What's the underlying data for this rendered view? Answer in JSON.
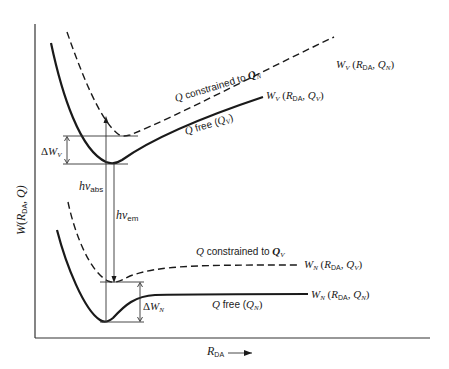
{
  "diagram": {
    "y_axis_label": {
      "main": "W",
      "open": "(",
      "sub_var": "R",
      "sub": "DA",
      "rest": ", Q)"
    },
    "x_axis_label": {
      "main": "R",
      "sub": "DA"
    },
    "curves": {
      "upper_dashed": {
        "annotation": {
          "q": "Q",
          "text": " constrained to ",
          "q2": "Q",
          "q2_sub": "N"
        },
        "end_label": {
          "w": "W",
          "w_sub": "V",
          "open": " (",
          "r": "R",
          "r_sub": "DA",
          "mid": ", ",
          "q": "Q",
          "q_sub": "N",
          "close": ")"
        }
      },
      "upper_solid": {
        "annotation": {
          "q": "Q",
          "text": " free (",
          "q2": "Q",
          "q2_sub": "V",
          "close": ")"
        },
        "end_label": {
          "w": "W",
          "w_sub": "V",
          "open": " (",
          "r": "R",
          "r_sub": "DA",
          "mid": ", ",
          "q": "Q",
          "q_sub": "V",
          "close": ")"
        }
      },
      "lower_dashed": {
        "annotation": {
          "q": "Q",
          "text": " constrained to ",
          "q2": "Q",
          "q2_sub": "V"
        },
        "end_label": {
          "w": "W",
          "w_sub": "N",
          "open": " (",
          "r": "R",
          "r_sub": "DA",
          "mid": ", ",
          "q": "Q",
          "q_sub": "V",
          "close": ")"
        }
      },
      "lower_solid": {
        "annotation": {
          "q": "Q",
          "text": " free (",
          "q2": "Q",
          "q2_sub": "N",
          "close": ")"
        },
        "end_label": {
          "w": "W",
          "w_sub": "N",
          "open": " (",
          "r": "R",
          "r_sub": "DA",
          "mid": ", ",
          "q": "Q",
          "q_sub": "N",
          "close": ")"
        }
      }
    },
    "delta_upper": {
      "delta": "Δ",
      "w": "W",
      "sub": "V"
    },
    "delta_lower": {
      "delta": "Δ",
      "w": "W",
      "sub": "N"
    },
    "absorption": {
      "h": "h",
      "nu": "ν",
      "sub": "abs"
    },
    "emission": {
      "h": "h",
      "nu": "ν",
      "sub": "em"
    }
  }
}
